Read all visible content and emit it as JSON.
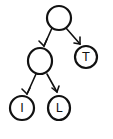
{
  "diagram": {
    "type": "tree",
    "nodes": [
      {
        "id": "root",
        "label": ""
      },
      {
        "id": "left",
        "label": ""
      },
      {
        "id": "right",
        "label": "T"
      },
      {
        "id": "left-left",
        "label": "I"
      },
      {
        "id": "left-right",
        "label": "L"
      }
    ],
    "edges": [
      {
        "from": "root",
        "to": "left"
      },
      {
        "from": "root",
        "to": "right"
      },
      {
        "from": "left",
        "to": "left-left"
      },
      {
        "from": "left",
        "to": "left-right"
      }
    ]
  }
}
